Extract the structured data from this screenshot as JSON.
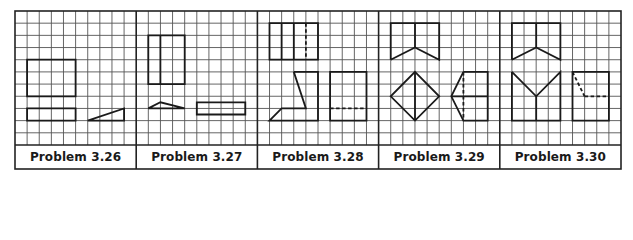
{
  "figure": {
    "grid": {
      "origin_x": 15,
      "origin_y": 11,
      "cell_w": 12.12,
      "cell_h": 12.18,
      "cols_per_panel": 10,
      "rows": 11,
      "panels": 5
    },
    "colors": {
      "grid": "#555555",
      "shape": "#1a1a1a",
      "border": "#222222"
    }
  },
  "panels": [
    {
      "label": "Problem 3.26",
      "shapes": [
        {
          "type": "poly",
          "closed": true,
          "points": [
            [
              1,
              4
            ],
            [
              5,
              4
            ],
            [
              5,
              7
            ],
            [
              1,
              7
            ]
          ]
        },
        {
          "type": "poly",
          "closed": true,
          "points": [
            [
              1,
              8
            ],
            [
              5,
              8
            ],
            [
              5,
              9
            ],
            [
              1,
              9
            ]
          ]
        },
        {
          "type": "poly",
          "closed": true,
          "points": [
            [
              6,
              9
            ],
            [
              9,
              8
            ],
            [
              9,
              9
            ]
          ]
        }
      ]
    },
    {
      "label": "Problem 3.27",
      "shapes": [
        {
          "type": "poly",
          "closed": true,
          "points": [
            [
              1,
              2
            ],
            [
              4,
              2
            ],
            [
              4,
              6
            ],
            [
              1,
              6
            ]
          ]
        },
        {
          "type": "line",
          "points": [
            [
              2,
              2
            ],
            [
              2,
              6
            ]
          ]
        },
        {
          "type": "poly",
          "closed": true,
          "points": [
            [
              1,
              8
            ],
            [
              2,
              7.5
            ],
            [
              4,
              8
            ]
          ]
        },
        {
          "type": "poly",
          "closed": true,
          "points": [
            [
              5,
              7.5
            ],
            [
              9,
              7.5
            ],
            [
              9,
              8.5
            ],
            [
              5,
              8.5
            ]
          ]
        }
      ]
    },
    {
      "label": "Problem 3.28",
      "shapes": [
        {
          "type": "poly",
          "closed": true,
          "points": [
            [
              1,
              1
            ],
            [
              5,
              1
            ],
            [
              5,
              4
            ],
            [
              1,
              4
            ]
          ]
        },
        {
          "type": "line",
          "points": [
            [
              2,
              1
            ],
            [
              2,
              4
            ]
          ]
        },
        {
          "type": "line",
          "points": [
            [
              3,
              1
            ],
            [
              3,
              4
            ]
          ]
        },
        {
          "type": "line",
          "dashed": true,
          "points": [
            [
              4,
              1
            ],
            [
              4,
              4
            ]
          ]
        },
        {
          "type": "poly",
          "closed": false,
          "points": [
            [
              3,
              5
            ],
            [
              5,
              5
            ],
            [
              5,
              9
            ],
            [
              1,
              9
            ],
            [
              2,
              8
            ],
            [
              4,
              8
            ],
            [
              3,
              5
            ]
          ]
        },
        {
          "type": "poly",
          "closed": true,
          "points": [
            [
              6,
              5
            ],
            [
              9,
              5
            ],
            [
              9,
              9
            ],
            [
              6,
              9
            ]
          ]
        },
        {
          "type": "line",
          "dashed": true,
          "points": [
            [
              6,
              8
            ],
            [
              9,
              8
            ]
          ]
        }
      ]
    },
    {
      "label": "Problem 3.29",
      "shapes": [
        {
          "type": "poly",
          "closed": false,
          "points": [
            [
              1,
              4
            ],
            [
              1,
              1
            ],
            [
              5,
              1
            ],
            [
              5,
              4
            ],
            [
              3,
              3
            ],
            [
              1,
              4
            ]
          ]
        },
        {
          "type": "line",
          "points": [
            [
              3,
              1
            ],
            [
              3,
              3
            ]
          ]
        },
        {
          "type": "poly",
          "closed": true,
          "points": [
            [
              3,
              5
            ],
            [
              5,
              7
            ],
            [
              3,
              9
            ],
            [
              1,
              7
            ]
          ]
        },
        {
          "type": "line",
          "points": [
            [
              3,
              5
            ],
            [
              3,
              9
            ]
          ]
        },
        {
          "type": "poly",
          "closed": false,
          "points": [
            [
              7,
              5
            ],
            [
              9,
              5
            ],
            [
              9,
              9
            ],
            [
              7,
              9
            ],
            [
              6,
              7
            ],
            [
              7,
              5
            ]
          ]
        },
        {
          "type": "line",
          "dashed": true,
          "points": [
            [
              7,
              5
            ],
            [
              7,
              9
            ]
          ]
        },
        {
          "type": "line",
          "points": [
            [
              6,
              7
            ],
            [
              9,
              7
            ]
          ]
        }
      ]
    },
    {
      "label": "Problem 3.30",
      "shapes": [
        {
          "type": "poly",
          "closed": false,
          "points": [
            [
              1,
              4
            ],
            [
              1,
              1
            ],
            [
              5,
              1
            ],
            [
              5,
              4
            ],
            [
              3,
              3
            ],
            [
              1,
              4
            ]
          ]
        },
        {
          "type": "line",
          "points": [
            [
              3,
              1
            ],
            [
              3,
              3
            ]
          ]
        },
        {
          "type": "poly",
          "closed": false,
          "points": [
            [
              1,
              5
            ],
            [
              1,
              9
            ],
            [
              5,
              9
            ],
            [
              5,
              5
            ],
            [
              3,
              7
            ],
            [
              1,
              5
            ]
          ]
        },
        {
          "type": "line",
          "points": [
            [
              3,
              7
            ],
            [
              3,
              9
            ]
          ]
        },
        {
          "type": "poly",
          "closed": true,
          "points": [
            [
              6,
              5
            ],
            [
              9,
              5
            ],
            [
              9,
              9
            ],
            [
              6,
              9
            ]
          ]
        },
        {
          "type": "line",
          "dashed": true,
          "points": [
            [
              6,
              5
            ],
            [
              7,
              7
            ]
          ]
        },
        {
          "type": "line",
          "dashed": true,
          "points": [
            [
              7,
              7
            ],
            [
              9,
              7
            ]
          ]
        }
      ]
    }
  ]
}
